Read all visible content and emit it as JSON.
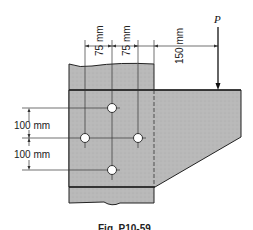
{
  "figure": {
    "load_label": "P",
    "dimensions": {
      "horizontal": [
        "75 mm",
        "75 mm",
        "150 mm"
      ],
      "vertical": [
        "100 mm",
        "100 mm"
      ]
    },
    "caption": "Fig. P10-59",
    "colors": {
      "steel_fill": "#b9b9b9",
      "line": "#222222",
      "background": "#ffffff"
    }
  }
}
